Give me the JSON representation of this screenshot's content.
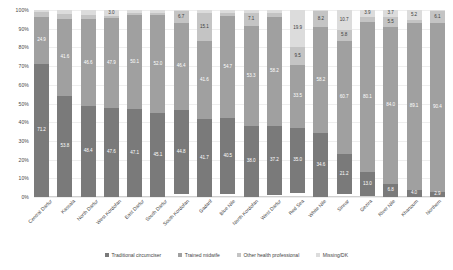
{
  "chart_data": {
    "type": "bar",
    "subtype": "stacked-100-percent",
    "title": "",
    "xlabel": "",
    "ylabel": "",
    "ylim": [
      0,
      100
    ],
    "y_tick_labels": [
      "0%",
      "10%",
      "20%",
      "30%",
      "40%",
      "50%",
      "60%",
      "70%",
      "80%",
      "90%",
      "100%"
    ],
    "y_ticks": [
      0,
      10,
      20,
      30,
      40,
      50,
      60,
      70,
      80,
      90,
      100
    ],
    "grid": true,
    "legend_position": "bottom",
    "categories": [
      "Central Darfur",
      "Kassala",
      "North Darfur",
      "West Kordofan",
      "East Darfur",
      "South Darfur",
      "South Kordofan",
      "Gadarif",
      "Blue Nile",
      "North Kordofan",
      "West Darfur",
      "Red Sea",
      "White Nile",
      "Sinnar",
      "Gezira",
      "River Nile",
      "Khartoum",
      "Northern"
    ],
    "series": [
      {
        "name": "Traditional circumciser",
        "color": "#7a7a7a",
        "values": [
          71.2,
          53.8,
          48.4,
          47.6,
          47.1,
          45.1,
          44.8,
          41.7,
          40.5,
          38.0,
          37.2,
          35.0,
          34.6,
          21.2,
          13.0,
          6.8,
          4.0,
          2.9
        ]
      },
      {
        "name": "Trained midwife",
        "color": "#a0a0a0",
        "values": [
          24.9,
          41.6,
          46.6,
          47.9,
          50.1,
          52.0,
          46.4,
          41.6,
          54.7,
          53.3,
          58.2,
          33.5,
          58.2,
          60.7,
          80.1,
          84.0,
          89.1,
          90.4
        ]
      },
      {
        "name": "Other health professional",
        "color": "#c4c4c4",
        "values": [
          2.6,
          2.5,
          2.5,
          1.5,
          1.4,
          1.4,
          6.7,
          15.1,
          1.7,
          7.1,
          2.1,
          9.5,
          8.2,
          5.8,
          2.7,
          5.5,
          1.7,
          6.1
        ]
      },
      {
        "name": "Missing/DK",
        "color": "#dcdcdc",
        "values": [
          1.3,
          2.1,
          2.5,
          3.0,
          1.4,
          1.5,
          0.4,
          1.6,
          1.5,
          1.5,
          1.5,
          19.9,
          0.8,
          10.7,
          3.9,
          3.7,
          5.2,
          0.6
        ]
      }
    ],
    "bar_labels": {
      "Central Darfur": [
        "71.2",
        "24.9",
        "2.6",
        "1.3"
      ],
      "Kassala": [
        "53.8",
        "41.6",
        "2.5",
        "2.1"
      ],
      "North Darfur": [
        "48.4",
        "46.6",
        "2.5",
        "2.5"
      ],
      "West Kordofan": [
        "47.6",
        "47.9",
        "1.5",
        "3.0"
      ],
      "East Darfur": [
        "47.1",
        "50.1",
        "1.4",
        "1.4"
      ],
      "South Darfur": [
        "45.1",
        "52.0",
        "1.4",
        "1.2"
      ],
      "South Kordofan": [
        "44.8",
        "46.4",
        "6.7",
        "0.4"
      ],
      "Gadarif": [
        "41.7",
        "41.6",
        "15.1",
        "1.6"
      ],
      "Blue Nile": [
        "40.5",
        "54.7",
        "1.7",
        "1.5"
      ],
      "North Kordofan": [
        "38.0",
        "53.3",
        "7.1",
        "1.5"
      ],
      "West Darfur": [
        "37.2",
        "58.2",
        "2.1",
        "1.5"
      ],
      "Red Sea": [
        "35.0",
        "33.5",
        "9.5",
        "19.9"
      ],
      "White Nile": [
        "34.6",
        "58.2",
        "8.2",
        "0.8"
      ],
      "Sinnar": [
        "21.2",
        "60.7",
        "5.8",
        "10.7"
      ],
      "Gezira": [
        "13.0",
        "80.1",
        "2.7",
        "3.9"
      ],
      "River Nile": [
        "6.8",
        "84.0",
        "5.5",
        "3.7"
      ],
      "Khartoum": [
        "4.0",
        "89.1",
        "1.7",
        "5.2"
      ],
      "Northern": [
        "2.9",
        "90.4",
        "6.1",
        "0.6"
      ]
    }
  },
  "legend": {
    "items": [
      {
        "label": "Traditional circumciser",
        "color": "#7a7a7a"
      },
      {
        "label": "Trained midwife",
        "color": "#a0a0a0"
      },
      {
        "label": "Other health professional",
        "color": "#c4c4c4"
      },
      {
        "label": "Missing/DK",
        "color": "#dcdcdc"
      }
    ]
  }
}
